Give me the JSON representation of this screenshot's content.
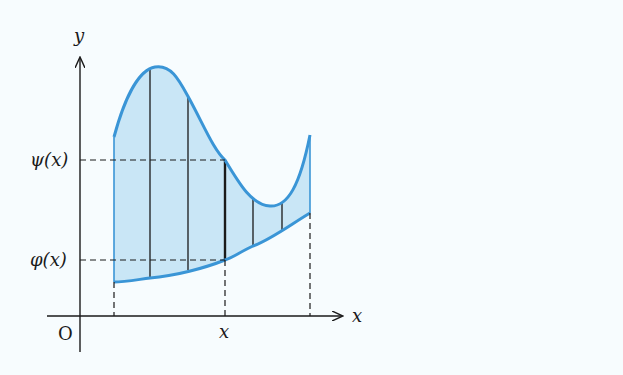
{
  "figure": {
    "type": "region between two curves (vertically simple region)",
    "axes": {
      "x_label": "x",
      "y_label": "y",
      "origin_label": "O"
    },
    "labels": {
      "upper_curve": "ψ(x)",
      "lower_curve": "φ(x)",
      "x_mark": "x"
    },
    "colors": {
      "curve": "#3a95d6",
      "fill": "#c9e6f6",
      "axis": "#1a1a1a",
      "background": "#f7fcfe"
    }
  }
}
